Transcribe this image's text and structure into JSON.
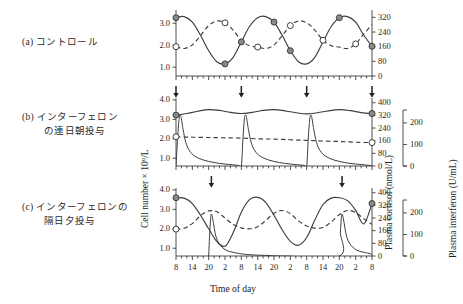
{
  "figure": {
    "panels": [
      {
        "tag": "(a)",
        "lines": [
          "コントロール"
        ]
      },
      {
        "tag": "(b)",
        "lines": [
          "インターフェロン",
          "の連日朝投与"
        ]
      },
      {
        "tag": "(c)",
        "lines": [
          "インターフェロンの",
          "隔日夕投与"
        ]
      }
    ],
    "axis_titles": {
      "y_left": "Cell number × 10⁹/L",
      "y_right": "Plasma cortisol  (nmol/L)",
      "y_right2": "Plasma interferon  (U/mL)",
      "x": "Time of day"
    }
  },
  "chart_data": {
    "type": "line",
    "title": "",
    "xlabel": "Time of day",
    "ylabel": "Cell number × 10⁹/L",
    "y2label": "Plasma cortisol  (nmol/L)",
    "y3label": "Plasma interferon  (U/mL)",
    "xlim": [
      8,
      80
    ],
    "x_tick_values": [
      8,
      14,
      20,
      26,
      32,
      38,
      44,
      50,
      56,
      62,
      68,
      74,
      80
    ],
    "x_tick_labels": [
      "8",
      "14",
      "20",
      "2",
      "8",
      "14",
      "20",
      "2",
      "8",
      "14",
      "20",
      "2",
      "8"
    ],
    "minor_tick_step": 2,
    "grid": false,
    "legend": "none",
    "series_styles": {
      "cell_number": {
        "style": "solid",
        "marker": "filled-circle",
        "color": "#3d3d3d"
      },
      "plasma_cortisol": {
        "style": "dashed",
        "marker": "open-circle",
        "color": "#3d3d3d"
      },
      "plasma_interferon": {
        "style": "solid",
        "marker": "none",
        "color": "#3d3d3d"
      }
    },
    "panels": [
      {
        "id": "a",
        "label": "(a) コントロール",
        "ylim_left": [
          0.6,
          3.6
        ],
        "y_ticks_left": [
          1.0,
          2.0,
          3.0
        ],
        "y_tick_labels_left": [
          "1.0",
          "2.0",
          "3.0"
        ],
        "ylim_right": [
          0,
          360
        ],
        "y_ticks_right": [
          0,
          80,
          160,
          240,
          320
        ],
        "y_tick_labels_right": [
          "0",
          "80",
          "160",
          "240",
          "320"
        ],
        "injection_arrows": [],
        "series": [
          {
            "name": "Cell number",
            "x": [
              8,
              11,
              14,
              17,
              20,
              23,
              26,
              29,
              32,
              35,
              38,
              41,
              44,
              47,
              50,
              53,
              56,
              59,
              62,
              65,
              68,
              71,
              74,
              77,
              80
            ],
            "values": [
              3.25,
              3.3,
              3.05,
              2.45,
              1.75,
              1.25,
              1.15,
              1.45,
              2.15,
              2.85,
              3.25,
              3.3,
              3.05,
              2.45,
              1.75,
              1.25,
              1.15,
              1.45,
              2.15,
              2.85,
              3.25,
              3.3,
              3.05,
              2.45,
              1.95
            ]
          },
          {
            "name": "Plasma cortisol",
            "x": [
              8,
              11,
              14,
              17,
              20,
              23,
              26,
              29,
              32,
              35,
              38,
              41,
              44,
              47,
              50,
              53,
              56,
              59,
              62,
              65,
              68,
              71,
              74,
              77,
              80
            ],
            "values": [
              160,
              150,
              170,
              220,
              275,
              300,
              290,
              250,
              195,
              165,
              158,
              150,
              170,
              220,
              275,
              300,
              290,
              250,
              195,
              165,
              158,
              150,
              175,
              230,
              280
            ]
          },
          {
            "name": "Plasma interferon",
            "x": [],
            "values": []
          }
        ],
        "markers": [
          {
            "series": "Cell number",
            "x": 8,
            "y": 3.25,
            "type": "filled-circle"
          },
          {
            "series": "Cell number",
            "x": 26,
            "y": 1.15,
            "type": "filled-circle"
          },
          {
            "series": "Cell number",
            "x": 32,
            "y": 2.15,
            "type": "filled-circle"
          },
          {
            "series": "Cell number",
            "x": 44,
            "y": 3.05,
            "type": "filled-circle"
          },
          {
            "series": "Cell number",
            "x": 50,
            "y": 1.75,
            "type": "filled-circle"
          },
          {
            "series": "Cell number",
            "x": 68,
            "y": 3.25,
            "type": "filled-circle"
          },
          {
            "series": "Cell number",
            "x": 80,
            "y": 1.95,
            "type": "filled-circle"
          },
          {
            "series": "Plasma cortisol",
            "x": 8,
            "y": 160,
            "type": "open-circle"
          },
          {
            "series": "Plasma cortisol",
            "x": 26,
            "y": 290,
            "type": "open-circle"
          },
          {
            "series": "Plasma cortisol",
            "x": 38,
            "y": 158,
            "type": "open-circle"
          },
          {
            "series": "Plasma cortisol",
            "x": 50,
            "y": 275,
            "type": "open-circle"
          },
          {
            "series": "Plasma cortisol",
            "x": 62,
            "y": 195,
            "type": "open-circle"
          },
          {
            "series": "Plasma cortisol",
            "x": 74,
            "y": 175,
            "type": "open-circle"
          }
        ]
      },
      {
        "id": "b",
        "label": "(b) インターフェロンの連日朝投与",
        "ylim_left": [
          0.6,
          4.1
        ],
        "y_ticks_left": [
          1.0,
          2.0,
          3.0,
          4.0
        ],
        "y_tick_labels_left": [
          "1.0",
          "2.0",
          "3.0",
          "4.0"
        ],
        "ylim_right": [
          0,
          430
        ],
        "y_ticks_right": [
          0,
          80,
          160,
          240,
          320,
          400
        ],
        "y_tick_labels_right": [
          "0",
          "80",
          "160",
          "240",
          "320",
          "400"
        ],
        "ylim_ifn": [
          0,
          260
        ],
        "y_ticks_ifn": [
          0,
          100,
          200
        ],
        "y_tick_labels_ifn": [
          "0",
          "100",
          "200"
        ],
        "injection_arrows": [
          8,
          32,
          56,
          80
        ],
        "injection_time": "08:00 daily",
        "series": [
          {
            "name": "Cell number",
            "x": [
              8,
              12,
              16,
              20,
              24,
              28,
              32,
              36,
              40,
              44,
              48,
              52,
              56,
              60,
              64,
              68,
              72,
              76,
              80
            ],
            "values": [
              3.22,
              3.3,
              3.42,
              3.5,
              3.46,
              3.36,
              3.3,
              3.36,
              3.46,
              3.5,
              3.44,
              3.34,
              3.28,
              3.34,
              3.44,
              3.5,
              3.45,
              3.35,
              3.3
            ]
          },
          {
            "name": "Plasma cortisol",
            "x": [
              8,
              14,
              20,
              26,
              32,
              38,
              44,
              50,
              56,
              62,
              68,
              74,
              80
            ],
            "values": [
              185,
              182,
              180,
              178,
              176,
              172,
              170,
              166,
              162,
              158,
              155,
              150,
              148
            ]
          },
          {
            "name": "Plasma interferon",
            "x": [
              8,
              8.6,
              9.2,
              9.8,
              10.6,
              11.6,
              13,
              15,
              18,
              22,
              26,
              31,
              32,
              32.6,
              33.2,
              33.8,
              34.6,
              35.6,
              37,
              39,
              42,
              46,
              50,
              55,
              56,
              56.6,
              57.2,
              57.8,
              58.6,
              59.6,
              61,
              63,
              66,
              70,
              74,
              79,
              80
            ],
            "values": [
              0,
              130,
              225,
              230,
              170,
              110,
              70,
              45,
              28,
              16,
              9,
              3,
              0,
              130,
              225,
              230,
              170,
              110,
              70,
              45,
              28,
              16,
              9,
              3,
              0,
              130,
              225,
              230,
              170,
              110,
              70,
              45,
              28,
              16,
              9,
              3,
              0
            ]
          }
        ],
        "markers": [
          {
            "series": "Cell number",
            "x": 8,
            "y": 3.22,
            "type": "filled-circle"
          },
          {
            "series": "Cell number",
            "x": 80,
            "y": 3.3,
            "type": "filled-circle"
          },
          {
            "series": "Plasma cortisol",
            "x": 8,
            "y": 185,
            "type": "open-circle"
          },
          {
            "series": "Plasma cortisol",
            "x": 80,
            "y": 148,
            "type": "open-circle"
          }
        ]
      },
      {
        "id": "c",
        "label": "(c) インターフェロンの隔日夕投与",
        "ylim_left": [
          0.6,
          4.1
        ],
        "y_ticks_left": [
          1.0,
          2.0,
          3.0,
          4.0
        ],
        "y_tick_labels_left": [
          "1.0",
          "2.0",
          "3.0",
          "4.0"
        ],
        "ylim_right": [
          0,
          430
        ],
        "y_ticks_right": [
          0,
          80,
          160,
          240,
          320,
          400
        ],
        "y_tick_labels_right": [
          "0",
          "80",
          "160",
          "240",
          "320",
          "400"
        ],
        "ylim_ifn": [
          0,
          260
        ],
        "y_ticks_ifn": [
          0,
          100,
          200
        ],
        "y_tick_labels_ifn": [
          "0",
          "100",
          "200"
        ],
        "injection_arrows": [
          21,
          69
        ],
        "injection_time": "20:00 every other day",
        "series": [
          {
            "name": "Cell number",
            "x": [
              8,
              11,
              14,
              17,
              20,
              23,
              26,
              29,
              32,
              35,
              38,
              41,
              44,
              47,
              50,
              53,
              56,
              59,
              62,
              65,
              68,
              71,
              74,
              77,
              80
            ],
            "values": [
              3.6,
              3.58,
              3.3,
              2.7,
              2.0,
              1.35,
              1.1,
              1.8,
              2.85,
              3.5,
              3.62,
              3.35,
              2.7,
              1.95,
              1.35,
              1.15,
              1.55,
              2.45,
              3.25,
              3.58,
              3.6,
              3.45,
              2.95,
              2.25,
              3.3
            ]
          },
          {
            "name": "Plasma cortisol",
            "x": [
              8,
              11,
              14,
              17,
              20,
              23,
              26,
              29,
              32,
              35,
              38,
              41,
              44,
              47,
              50,
              53,
              56,
              59,
              62,
              65,
              68,
              71,
              74,
              77,
              80
            ],
            "values": [
              170,
              175,
              205,
              255,
              285,
              280,
              240,
              200,
              178,
              172,
              185,
              225,
              270,
              288,
              268,
              222,
              190,
              176,
              180,
              215,
              262,
              288,
              275,
              235,
              200
            ]
          },
          {
            "name": "Plasma interferon",
            "x": [
              20,
              20.4,
              20.8,
              21.2,
              21.8,
              22.4,
              23.2,
              24.4,
              26,
              28,
              31,
              34,
              38,
              43,
              48,
              68,
              68.4,
              68.8,
              69.2,
              69.8,
              70.4,
              71.2,
              72.4,
              74,
              76,
              79,
              80
            ],
            "values": [
              0,
              110,
              185,
              190,
              150,
              105,
              72,
              48,
              30,
              20,
              12,
              7,
              4,
              2,
              0,
              0,
              110,
              185,
              190,
              150,
              105,
              72,
              48,
              30,
              20,
              12,
              6
            ]
          }
        ],
        "markers": [
          {
            "series": "Cell number",
            "x": 8,
            "y": 3.6,
            "type": "filled-circle"
          },
          {
            "series": "Cell number",
            "x": 80,
            "y": 3.3,
            "type": "filled-circle"
          },
          {
            "series": "Plasma cortisol",
            "x": 8,
            "y": 170,
            "type": "open-circle"
          }
        ]
      }
    ]
  }
}
